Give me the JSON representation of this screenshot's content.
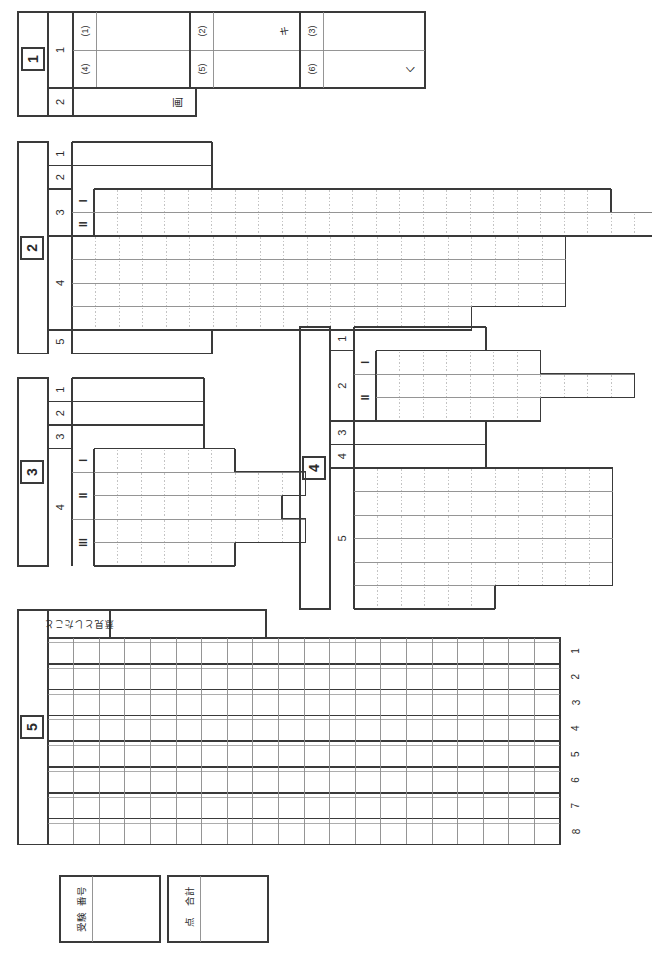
{
  "document": {
    "type": "exam-answer-sheet",
    "language": "ja",
    "orientation": "rotated-90-ccw",
    "page_width": 652,
    "page_height": 958,
    "colors": {
      "outer_rule": "#3a3a3a",
      "inner_rule": "#8a8a8a",
      "dotted_rule": "#b4b4b4",
      "paper": "#ffffff",
      "ink": "#2b2b2b",
      "handwriting": "#777777"
    }
  },
  "sections": [
    {
      "id": "section-1",
      "number": "1",
      "rows": [
        {
          "label": "1",
          "subcells": [
            {
              "marker": "(1)",
              "answer": ""
            },
            {
              "marker": "(2)",
              "answer": "キ"
            },
            {
              "marker": "(3)",
              "answer": ""
            },
            {
              "marker": "(4)",
              "answer": ""
            },
            {
              "marker": "(5)",
              "answer": ""
            },
            {
              "marker": "(6)",
              "answer": "く"
            }
          ]
        },
        {
          "label": "2",
          "subcells": [
            {
              "marker": "",
              "answer": "画"
            }
          ]
        }
      ]
    },
    {
      "id": "section-2",
      "number": "2",
      "rows": [
        {
          "label": "1",
          "sub": "",
          "kind": "line",
          "cells": 0
        },
        {
          "label": "2",
          "sub": "",
          "kind": "line",
          "cells": 0
        },
        {
          "label": "3",
          "sub": "I",
          "kind": "grid",
          "cells": 22
        },
        {
          "label": "3",
          "sub": "II",
          "kind": "grid",
          "cells": 24
        },
        {
          "label": "4",
          "sub": "",
          "kind": "grid",
          "cells": 21
        },
        {
          "label": "4",
          "sub": "",
          "kind": "grid",
          "cells": 21
        },
        {
          "label": "4",
          "sub": "",
          "kind": "grid",
          "cells": 21
        },
        {
          "label": "4",
          "sub": "",
          "kind": "grid",
          "cells": 17
        },
        {
          "label": "5",
          "sub": "",
          "kind": "line",
          "cells": 0
        }
      ]
    },
    {
      "id": "section-3",
      "number": "3",
      "rows": [
        {
          "label": "1",
          "sub": "",
          "kind": "line",
          "cells": 0
        },
        {
          "label": "2",
          "sub": "",
          "kind": "line",
          "cells": 0
        },
        {
          "label": "3",
          "sub": "",
          "kind": "line",
          "cells": 0
        },
        {
          "label": "4",
          "sub": "I",
          "kind": "grid",
          "cells": 6
        },
        {
          "label": "4",
          "sub": "II",
          "kind": "grid",
          "cells": 9
        },
        {
          "label": "4",
          "sub": "II",
          "kind": "grid",
          "cells": 8
        },
        {
          "label": "4",
          "sub": "III",
          "kind": "grid",
          "cells": 9
        },
        {
          "label": "4",
          "sub": "III",
          "kind": "grid",
          "cells": 6
        }
      ]
    },
    {
      "id": "section-4",
      "number": "4",
      "rows": [
        {
          "label": "1",
          "sub": "",
          "kind": "line",
          "cells": 0
        },
        {
          "label": "2",
          "sub": "I",
          "kind": "grid",
          "cells": 7
        },
        {
          "label": "2",
          "sub": "II",
          "kind": "grid",
          "cells": 11
        },
        {
          "label": "2",
          "sub": "II",
          "kind": "grid",
          "cells": 7
        },
        {
          "label": "3",
          "sub": "",
          "kind": "line",
          "cells": 0
        },
        {
          "label": "4",
          "sub": "",
          "kind": "line",
          "cells": 0
        },
        {
          "label": "5",
          "sub": "",
          "kind": "grid",
          "cells": 11
        },
        {
          "label": "5",
          "sub": "",
          "kind": "grid",
          "cells": 11
        },
        {
          "label": "5",
          "sub": "",
          "kind": "grid",
          "cells": 11
        },
        {
          "label": "5",
          "sub": "",
          "kind": "grid",
          "cells": 11
        },
        {
          "label": "5",
          "sub": "",
          "kind": "grid",
          "cells": 11
        },
        {
          "label": "5",
          "sub": "",
          "kind": "grid",
          "cells": 6
        }
      ]
    },
    {
      "id": "section-5",
      "number": "5",
      "header_label": "意見としたこと",
      "header_value": "",
      "grid": {
        "rows": 8,
        "columns": 20,
        "row_numbers": [
          "1",
          "2",
          "3",
          "4",
          "5",
          "6",
          "7",
          "8"
        ]
      }
    }
  ],
  "footer": {
    "examinee_box": {
      "line1": "受験",
      "line2": "番号",
      "value": ""
    },
    "score_box": {
      "line1": "合計",
      "line2": "点",
      "value": ""
    }
  }
}
